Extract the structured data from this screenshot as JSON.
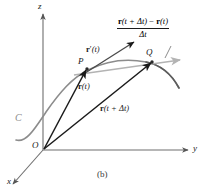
{
  "figure": {
    "caption": "(b)",
    "axes": {
      "x_label": "x",
      "y_label": "y",
      "z_label": "z",
      "origin_label": "O"
    },
    "curve": {
      "label": "C"
    },
    "points": {
      "p_label": "P",
      "q_label": "Q"
    },
    "vectors": {
      "position_t": {
        "bold": "r",
        "arg": "(t)"
      },
      "position_t_plus_dt": {
        "bold": "r",
        "arg": "(t + Δt)"
      },
      "derivative": {
        "bold": "r",
        "prime": "′",
        "arg": "(t)"
      }
    },
    "difference_quotient": {
      "numerator_bold_1": "r",
      "numerator_arg_1": "(t + Δt)",
      "numerator_minus": " − ",
      "numerator_bold_2": "r",
      "numerator_arg_2": "(t)",
      "denominator": "Δt"
    },
    "colors": {
      "curve": "#8c8c8c",
      "secant": "#b3b3b3",
      "vector": "#1a1a1a",
      "axis": "#6e6e6e",
      "background": "#ffffff"
    }
  }
}
